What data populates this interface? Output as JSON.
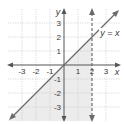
{
  "diagram": {
    "type": "coordinate-plane-inequality",
    "axes": {
      "x_label": "x",
      "y_label": "y",
      "x_ticks": [
        "-3",
        "-2",
        "-1",
        "1",
        "2",
        "3"
      ],
      "y_ticks": [
        "3",
        "2",
        "1",
        "-1",
        "-2",
        "-3"
      ],
      "range": [
        -4,
        4
      ]
    },
    "lines": [
      {
        "label": "y = x",
        "style": "solid",
        "equation": "y = x"
      },
      {
        "label": "x = 2",
        "style": "dashed",
        "equation": "x = 2"
      }
    ],
    "shaded_region": "below y = x and left of x = 2",
    "colors": {
      "line": "#6b6b6b",
      "grid": "#c8c8c8",
      "shade": "#ececec",
      "axis": "#555555"
    }
  }
}
